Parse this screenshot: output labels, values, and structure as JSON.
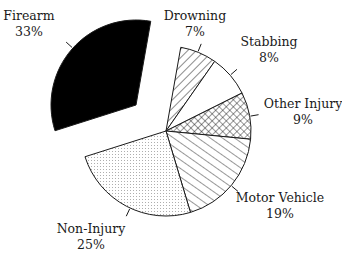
{
  "chart_data": {
    "type": "pie",
    "title": "",
    "start_angle_deg": 10,
    "direction": "clockwise",
    "slices": [
      {
        "label": "Drowning",
        "value": 7,
        "pct_label": "7%",
        "pattern": "diag-back",
        "exploded": false,
        "label_pos": [
          195,
          20
        ],
        "tick_angle": 22
      },
      {
        "label": "Stabbing",
        "value": 8,
        "pct_label": "8%",
        "pattern": "white",
        "exploded": false,
        "label_pos": [
          269,
          46
        ],
        "tick_angle": 49
      },
      {
        "label": "Other Injury",
        "value": 9,
        "pct_label": "9%",
        "pattern": "crosshatch",
        "exploded": false,
        "label_pos": [
          303,
          108
        ],
        "tick_angle": 80
      },
      {
        "label": "Motor Vehicle",
        "value": 19,
        "pct_label": "19%",
        "pattern": "diag-forward",
        "exploded": false,
        "label_pos": [
          280,
          202
        ],
        "tick_angle": 130
      },
      {
        "label": "Non-Injury",
        "value": 25,
        "pct_label": "25%",
        "pattern": "dots",
        "exploded": false,
        "label_pos": [
          91,
          233
        ],
        "tick_angle": 205
      },
      {
        "label": "Firearm",
        "value": 33,
        "pct_label": "33%",
        "pattern": "solid-black",
        "exploded": true,
        "label_pos": [
          29,
          20
        ],
        "tick_angle": 312
      }
    ],
    "legend": "none",
    "labels": "outside with tick marks"
  },
  "geometry": {
    "center": [
      166,
      131
    ],
    "radius": 85,
    "explode_offset": [
      -30,
      -26
    ]
  },
  "colors": {
    "ink": "#1a1a1a",
    "background": "#ffffff",
    "firearm": "#000000",
    "dots": "#9a9a9a"
  }
}
